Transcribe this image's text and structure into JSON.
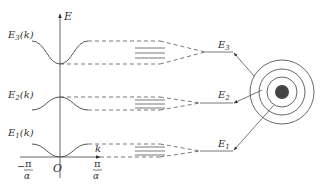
{
  "axes": {
    "y_label": "E",
    "x_label": "k",
    "origin_label": "O",
    "x_left_tick": {
      "sign": "−",
      "numerator": "π",
      "denominator": "α"
    },
    "x_right_tick": {
      "numerator": "π",
      "denominator": "α"
    }
  },
  "bands": [
    {
      "label": "E",
      "sub": "3",
      "arg": "(k)",
      "level_label": "E",
      "level_sub": "3"
    },
    {
      "label": "E",
      "sub": "2",
      "arg": "(k)",
      "level_label": "E",
      "level_sub": "2"
    },
    {
      "label": "E",
      "sub": "1",
      "arg": "(k)",
      "level_label": "E",
      "level_sub": "1"
    }
  ],
  "atom": {
    "shells": 3,
    "nucleus_color": "#444444"
  },
  "colors": {
    "line": "#555555",
    "text": "#333333"
  }
}
